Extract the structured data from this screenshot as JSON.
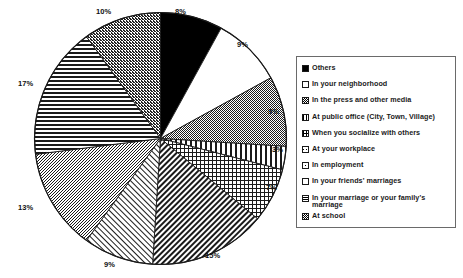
{
  "chart_data": {
    "type": "pie",
    "title": "",
    "xlabel": "",
    "ylabel": "",
    "legend_position": "right",
    "grid": false,
    "labels_show_percent": true,
    "categories": [
      "Others",
      "In your neighborhood",
      "In the press and other media",
      "At public office (City, Town, Village)",
      "When you socialize with others",
      "At your workplace",
      "In employment",
      "In your friends' marriages",
      "In your marriage or your family's marriage",
      "At school"
    ],
    "values": [
      8,
      9,
      9,
      3,
      7,
      15,
      9,
      13,
      17,
      10
    ],
    "value_labels": [
      "8%",
      "9%",
      "9%",
      "3%",
      "7%",
      "15%",
      "9%",
      "13%",
      "17%",
      "10%"
    ],
    "patterns": [
      "solid-black",
      "white",
      "dense-stipple",
      "vertical-bars",
      "crosshatch-grid",
      "diagonal-hatch",
      "light-diagonal",
      "medium-stipple",
      "horizontal-lines",
      "dark-stipple"
    ]
  },
  "pie": {
    "slices": [
      {
        "label": "8%",
        "value": 8,
        "pct_x": 175,
        "pct_y": 8,
        "name": "Others"
      },
      {
        "label": "9%",
        "value": 9,
        "pct_x": 237,
        "pct_y": 41,
        "name": "In your neighborhood"
      },
      {
        "label": "9%",
        "value": 9,
        "pct_x": 268,
        "pct_y": 108,
        "name": "In the press and other media"
      },
      {
        "label": "3%",
        "value": 3,
        "pct_x": 272,
        "pct_y": 146,
        "name": "At public office (City, Town, Village)"
      },
      {
        "label": "7%",
        "value": 7,
        "pct_x": 266,
        "pct_y": 184,
        "name": "When you socialize with others"
      },
      {
        "label": "15%",
        "value": 15,
        "pct_x": 205,
        "pct_y": 252,
        "name": "At your workplace"
      },
      {
        "label": "9%",
        "value": 9,
        "pct_x": 104,
        "pct_y": 261,
        "name": "In employment"
      },
      {
        "label": "13%",
        "value": 13,
        "pct_x": 18,
        "pct_y": 204,
        "name": "In your friends' marriages"
      },
      {
        "label": "17%",
        "value": 17,
        "pct_x": 18,
        "pct_y": 80,
        "name": "In your marriage or your family's marriage"
      },
      {
        "label": "10%",
        "value": 10,
        "pct_x": 96,
        "pct_y": 8,
        "name": "At school"
      }
    ]
  },
  "legend": {
    "items": [
      {
        "label": "Others",
        "swatch": "solid-black"
      },
      {
        "label": "In your neighborhood",
        "swatch": "white"
      },
      {
        "label": "In the press and other media",
        "swatch": "dense-stipple"
      },
      {
        "label": "At public office (City, Town, Village)",
        "swatch": "vertical-bars"
      },
      {
        "label": "When you socialize with others",
        "swatch": "crosshatch-grid"
      },
      {
        "label": "At your workplace",
        "swatch": "diagonal-hatch"
      },
      {
        "label": "In employment",
        "swatch": "light-diagonal"
      },
      {
        "label": "In your friends' marriages",
        "swatch": "medium-stipple"
      },
      {
        "label": "In your marriage or your family's marriage",
        "swatch": "horizontal-lines"
      },
      {
        "label": "At school",
        "swatch": "dark-stipple"
      }
    ]
  },
  "colors": {
    "ink": "#1a1a1a",
    "border": "#6a6a6a",
    "background": "#ffffff"
  }
}
